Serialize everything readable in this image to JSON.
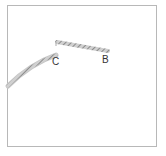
{
  "diagram": {
    "labels": {
      "c": "C",
      "b": "B"
    },
    "colors": {
      "frame": "#b8b8b8",
      "line": "#8a8a8a",
      "hatch": "#bdbdbd",
      "text": "#333333"
    }
  }
}
